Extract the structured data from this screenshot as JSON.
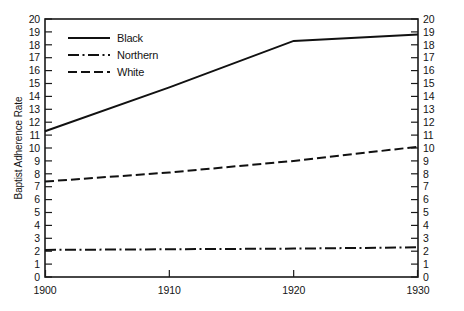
{
  "chart_data": {
    "type": "line",
    "title": "",
    "xlabel": "",
    "ylabel": "Baptist Adherence Rate",
    "x": [
      1900,
      1910,
      1920,
      1930
    ],
    "xtick_labels": [
      "1900",
      "1910",
      "1920",
      "1930"
    ],
    "xlim": [
      1900,
      1930
    ],
    "ylim": [
      0,
      20
    ],
    "ytick_labels": [
      "0",
      "1",
      "2",
      "3",
      "4",
      "5",
      "6",
      "7",
      "8",
      "9",
      "10",
      "11",
      "12",
      "13",
      "14",
      "15",
      "16",
      "17",
      "18",
      "19",
      "20"
    ],
    "ytick_values": [
      0,
      1,
      2,
      3,
      4,
      5,
      6,
      7,
      8,
      9,
      10,
      11,
      12,
      13,
      14,
      15,
      16,
      17,
      18,
      19,
      20
    ],
    "y_axis_right_labels": [
      "0",
      "1",
      "2",
      "3",
      "4",
      "5",
      "6",
      "7",
      "8",
      "9",
      "10",
      "11",
      "12",
      "13",
      "14",
      "15",
      "16",
      "17",
      "18",
      "19",
      "20"
    ],
    "grid": false,
    "legend_position": "upper-left-inside",
    "series": [
      {
        "name": "Black",
        "style": "solid",
        "color": "#111111",
        "values": [
          11.3,
          14.7,
          18.3,
          18.8
        ]
      },
      {
        "name": "Northern",
        "style": "dash-dot",
        "color": "#111111",
        "values": [
          2.1,
          2.15,
          2.2,
          2.3
        ]
      },
      {
        "name": "White",
        "style": "dashed",
        "color": "#111111",
        "values": [
          7.4,
          8.1,
          9.0,
          10.1
        ]
      }
    ]
  },
  "axes": {
    "y_title": "Baptist Adherence Rate",
    "y_left_ticks": [
      "20",
      "19",
      "18",
      "17",
      "16",
      "15",
      "14",
      "13",
      "12",
      "11",
      "10",
      "9",
      "8",
      "7",
      "6",
      "5",
      "4",
      "3",
      "2",
      "1",
      "0"
    ],
    "y_right_ticks": [
      "20",
      "19",
      "18",
      "17",
      "16",
      "15",
      "14",
      "13",
      "12",
      "11",
      "10",
      "9",
      "8",
      "7",
      "6",
      "5",
      "4",
      "3",
      "2",
      "1",
      "0"
    ],
    "x_ticks": [
      "1900",
      "1910",
      "1920",
      "1930"
    ]
  },
  "legend": {
    "entries": [
      {
        "label": "Black",
        "style": "solid"
      },
      {
        "label": "Northern",
        "style": "dash-dot"
      },
      {
        "label": "White",
        "style": "dashed"
      }
    ]
  }
}
